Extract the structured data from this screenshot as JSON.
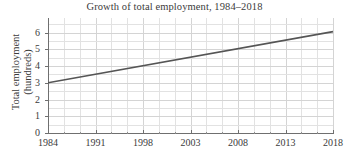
{
  "chart_data": {
    "type": "line",
    "title": "Growth of total employment, 1984–2018",
    "xlabel": "",
    "ylabel": "Total employment (hundreds)",
    "ylabel_line1": "Total employment",
    "ylabel_line2": "(hundreds)",
    "x": [
      1984,
      2018
    ],
    "values": [
      3.0,
      6.05
    ],
    "series": [
      {
        "name": "Total employment",
        "x": [
          1984,
          2018
        ],
        "values": [
          3.0,
          6.05
        ],
        "color": "#555555"
      }
    ],
    "x_tick_labels": [
      "1984",
      "1991",
      "1998",
      "2003",
      "2008",
      "2013",
      "2018"
    ],
    "x_tick_values": [
      1984,
      1991,
      1998,
      2003,
      2008,
      2013,
      2018
    ],
    "y_tick_labels": [
      "0",
      "1",
      "2",
      "3",
      "4",
      "5",
      "6"
    ],
    "y_tick_values": [
      0,
      1,
      2,
      3,
      4,
      5,
      6
    ],
    "xlim": [
      1984,
      2018
    ],
    "ylim": [
      0,
      6.86
    ],
    "grid": true,
    "grid_color": "#e2e2e2",
    "grid_minor_divisions_per_major": 3,
    "legend": null,
    "legend_position": "none",
    "annotations": [],
    "axis_color": "#6f6f6f",
    "text_color": "#3b3b3b",
    "background": "#ffffff"
  }
}
